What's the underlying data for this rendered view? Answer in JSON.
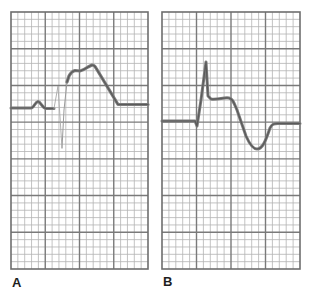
{
  "figure": {
    "type": "ecg-strip-comparison",
    "colors": {
      "background": "#ffffff",
      "grid_minor": "#b4b4b4",
      "grid_major": "#7a7a7a",
      "border": "#6e6e6e",
      "trace": "#7c7c7c",
      "trace_core": "#5a5a5a",
      "label": "#1e1e1e"
    },
    "grid": {
      "major_cols": 4,
      "major_rows": 7,
      "minor_per_major": 5
    },
    "panels": [
      {
        "label": "A",
        "box": {
          "x": 11,
          "y": 12,
          "width": 137,
          "height": 257
        },
        "description": "ST-segment elevation (injury current / monophasic curve) following the QRS complex",
        "trace": {
          "main_path": "M11,108 L31,108 C34,108 35,102 38,101.5 C41,102 42,108 46,108.5 L54,108.5",
          "faint_path": "M54,108.5 L58,86 L62,148",
          "main_path2": "M62,148 L64,110 L67,82 L69,76 C71,72 73,71 75,70.5 L80,71 C83,70.5 85,69 88,67 L92,65 C94,65 95,66 96,68 L118,104.5 L148,104.5"
        }
      },
      {
        "label": "B",
        "box": {
          "x": 162,
          "y": 12,
          "width": 138,
          "height": 257
        },
        "description": "QRS complex followed by ST-segment depression/inverted T wave",
        "trace": {
          "main_path": "M162,121 L195,121 L197,126 L201,100 L206,62 L208,96 L211,99 C218,100 224,97 229,98 C233,99 234,103 237,110 L246,136 C250,145 253,149 257,149 C262,149 265,143 270,128 C272,124 274,123.5 278,123.5 L300,123.5",
          "faint_path": "",
          "main_path2": ""
        }
      }
    ]
  }
}
